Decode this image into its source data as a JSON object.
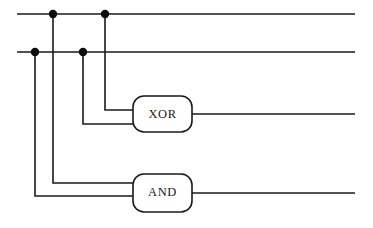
{
  "diagram": {
    "background_color": "#ffffff",
    "wire_color": "#1a1a1a",
    "junction_color": "#0d0d0d",
    "gate_fill": "#ffffff"
  },
  "gates": [
    {
      "id": "xor",
      "label": "XOR",
      "x": 133,
      "y": 96,
      "width": 59,
      "height": 36,
      "corner_radius": 11
    },
    {
      "id": "and",
      "label": "AND",
      "x": 133,
      "y": 174,
      "width": 59,
      "height": 38,
      "corner_radius": 11
    }
  ],
  "bus_lines": [
    {
      "id": "input-a-bus",
      "y": 14,
      "x_start": 17,
      "x_end": 355
    },
    {
      "id": "input-b-bus",
      "y": 52,
      "x_start": 17,
      "x_end": 355
    }
  ],
  "junctions": [
    {
      "id": "junction-a1",
      "x": 53,
      "y": 14,
      "r": 4.2
    },
    {
      "id": "junction-a2",
      "x": 105,
      "y": 14,
      "r": 4.2
    },
    {
      "id": "junction-b1",
      "x": 35,
      "y": 52,
      "r": 4.2
    },
    {
      "id": "junction-b2",
      "x": 83,
      "y": 52,
      "r": 4.2
    }
  ],
  "branch_wires": [
    {
      "id": "wire-a-to-xor",
      "path": "M105,14 L105,110 L133,110"
    },
    {
      "id": "wire-b-to-xor",
      "path": "M83,52 L83,124 L133,124"
    },
    {
      "id": "wire-a-to-and",
      "path": "M53,14 L53,183 L133,183"
    },
    {
      "id": "wire-b-to-and",
      "path": "M35,52 L35,196 L133,196"
    }
  ],
  "output_wires": [
    {
      "id": "xor-output",
      "path": "M192,114 L355,114"
    },
    {
      "id": "and-output",
      "path": "M192,193 L355,193"
    }
  ]
}
